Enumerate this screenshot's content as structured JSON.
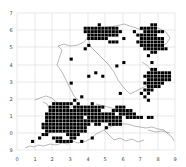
{
  "map": {
    "type": "grid-distribution-map",
    "plot_area_px": {
      "left": 17,
      "top": 13,
      "right": 175,
      "bottom": 150
    },
    "cell_px": {
      "w": 3.51,
      "h": 3.43
    },
    "colors": {
      "cell": "#000000",
      "grid": "#d8d8d8",
      "outline": "#8a8a8a",
      "background": "#ffffff"
    },
    "x_ticks": [
      {
        "label": "0",
        "x": 17
      },
      {
        "label": "1",
        "x": 35
      },
      {
        "label": "2",
        "x": 52
      },
      {
        "label": "3",
        "x": 70
      },
      {
        "label": "4",
        "x": 88
      },
      {
        "label": "5",
        "x": 105
      },
      {
        "label": "6",
        "x": 123
      },
      {
        "label": "7",
        "x": 140
      },
      {
        "label": "8",
        "x": 158
      },
      {
        "label": "9",
        "x": 175
      }
    ],
    "y_ticks": [
      {
        "label": "7",
        "y": 13
      },
      {
        "label": "6",
        "y": 30
      },
      {
        "label": "5",
        "y": 47
      },
      {
        "label": "4",
        "y": 65
      },
      {
        "label": "3",
        "y": 82
      },
      {
        "label": "2",
        "y": 99
      },
      {
        "label": "1",
        "y": 116
      },
      {
        "label": "0",
        "y": 133
      },
      {
        "label": "9",
        "y": 150
      }
    ],
    "rows": [
      ".............................................",
      ".............................................",
      ".............................................",
      ".......................#..............##.....",
      "...................##########......#####.....",
      "...................###########...#..######...",
      "....................#########.....######.....",
      "....................######....#....#######...",
      "..........................###.....########...",
      "....................#..............#######...",
      "...................#................#######..",
      "......................................##.....",
      ".....................................#.......",
      "...............#.............................",
      "..............................#.......#......",
      "............................#................",
      "......................................##.....",
      "......................#..............#######.",
      "....................#...#...........########.",
      ".....................................#######.",
      "...............#....................######...",
      ".....................................####....",
      "....................................###......",
      ".............................#.....#.#.......",
      "..................#.................#........",
      "................#....................#.......",
      "..........######.#...#....................",
      ".........######.#########...###.....",
      ".........###############...######...........",
      "........####################.#####...........",
      "........###########.##########.#####.##......",
      "........######################...............",
      ".......##############.##..####...............",
      ".......#############.....#...................",
      "........############.........................",
      ".......##.....####...........................",
      "......#...###..##....#.......................",
      "....#......#####..#..........................",
      ".............................................",
      "............................................."
    ],
    "outline_paths": [
      "M25,148 L30,146 L34,147 L38,145 L44,146 L50,144 L56,145 L62,143 L68,144 L72,141 L78,143 L86,141 L92,138 L96,134 L102,131 L108,128 L114,125 L120,124 L128,124 L134,126 L140,127 L146,128 L152,127 L158,129 L164,130 L168,134 L172,137 L174,141",
      "M43,102 L47,104 L50,110 L48,116 L51,122 L47,128 L49,134",
      "M35,100 L40,98 L46,96 L52,98 L56,102 L60,104",
      "M57,65 L60,56 L62,50 L58,46 L64,44 L70,46 L78,45 L84,42 L88,37 L92,32 L96,28",
      "M57,65 L62,72 L66,80 L70,88 L74,96 L78,100",
      "M92,32 L100,30 L108,27 L116,26 L124,24 L130,26 L136,28",
      "M136,28 L142,30 L150,27 L158,28 L166,32 L170,38 L166,44 L160,46",
      "M88,37 L90,46 L96,52 L102,58 L108,64 L114,72 L118,80 L124,88 L130,94",
      "M130,94 L138,90 L146,86 L150,80 L152,72 L148,66 L142,62",
      "M96,104 L104,106 L112,108 L120,110 L128,112 L136,114",
      "M60,104 L68,108 L76,106 L84,110 L90,112",
      "M104,130 L110,136 L114,140 L120,138 L126,141 L132,139 L138,142 L144,140",
      "M148,130 L156,132 L162,131 L170,133"
    ]
  }
}
